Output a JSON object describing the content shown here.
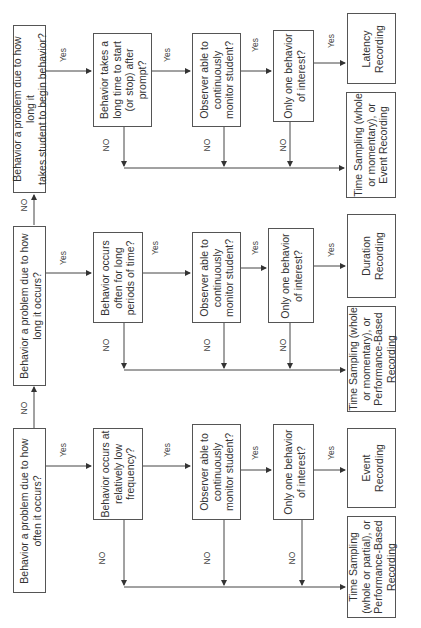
{
  "diagram": {
    "orientation": "rotated-90-ccw",
    "rows": [
      {
        "id": "latency",
        "entry_question": "Behavior a problem due to how long it\ntakes student to begin behavior?",
        "q2": "Behavior takes a\nlong time to start\n(or stop) after\nprompt?",
        "q3": "Observer able to\ncontinuously\nmonitor student?",
        "q4": "Only one behavior\nof interest?",
        "yes_result": "Latency\nRecording",
        "no_result": "Time Sampling (whole\nor momentary), or\nEvent Recording"
      },
      {
        "id": "duration",
        "entry_question": "Behavior a problem due to how\nlong it occurs?",
        "q2": "Behavior occurs\noften for long\nperiods of time?",
        "q3": "Observer able to\ncontinuously\nmonitor student?",
        "q4": "Only one behavior\nof interest?",
        "yes_result": "Duration\nRecording",
        "no_result": "Time Sampling (whole\nor momentary), or\nPerformance-Based\nRecording"
      },
      {
        "id": "frequency",
        "entry_question": "Behavior a problem due to how\noften it occurs?",
        "q2": "Behavior occurs at\nrelatively low\nfrequency?",
        "q3": "Observer able to\ncontinuously\nmonitor student?",
        "q4": "Only one behavior\nof interest?",
        "yes_result": "Event\nRecording",
        "no_result": "Time Sampling\n(whole or partial), or\nPerformance-Based\nRecording"
      }
    ],
    "labels": {
      "yes": "Yes",
      "no": "NO"
    }
  }
}
